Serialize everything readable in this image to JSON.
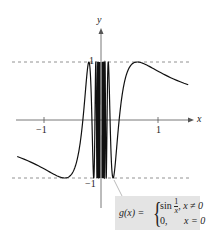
{
  "chart_data": {
    "type": "line",
    "title": "",
    "function": "g(x) = sin(1/x) for x != 0; 0 for x = 0",
    "xlabel": "x",
    "ylabel": "y",
    "x_ticks": [
      {
        "value": -1,
        "label": "−1"
      },
      {
        "value": 1,
        "label": "1"
      }
    ],
    "y_ticks": [
      {
        "value": 1,
        "label": "1"
      },
      {
        "value": -1,
        "label": "−1"
      }
    ],
    "xlim": [
      -1.5,
      1.55
    ],
    "ylim": [
      -1.2,
      1.6
    ],
    "reference_lines": [
      {
        "y": 1,
        "style": "dashed"
      },
      {
        "y": -1,
        "style": "dashed"
      }
    ],
    "grid": false,
    "series": [
      {
        "name": "g(x)",
        "expr": "sin(1/x)",
        "x_range": [
          -1.47,
          1.53
        ]
      }
    ]
  },
  "axes": {
    "x_label": "x",
    "y_label": "y",
    "tick_neg1_x": "−1",
    "tick_pos1_x": "1",
    "tick_pos1_y": "1",
    "tick_neg1_y": "−1"
  },
  "formula": {
    "lhs": "g(x) =",
    "row1_func": "sin",
    "row1_num": "1",
    "row1_den": "x",
    "row1_cond": ", x ≠ 0",
    "row2_val": "0,",
    "row2_cond": "x = 0"
  },
  "colors": {
    "curve": "#111111",
    "axis": "#555555",
    "dash": "#777777",
    "formula_bg": "#e4e4e4"
  }
}
